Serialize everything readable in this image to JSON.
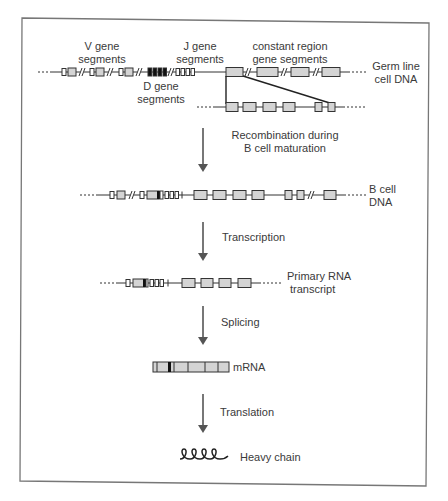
{
  "figure": {
    "stages": {
      "germline": {
        "label_v": "V gene\nsegments",
        "label_v_line1": "V gene",
        "label_v_line2": "segments",
        "label_d_line1": "D gene",
        "label_d_line2": "segments",
        "label_j_line1": "J gene",
        "label_j_line2": "segments",
        "label_c_line1": "constant region",
        "label_c_line2": "gene segments",
        "side_label_line1": "Germ line",
        "side_label_line2": "cell DNA"
      },
      "bcell": {
        "side_label_line1": "B cell",
        "side_label_line2": "DNA"
      },
      "primary_rna": {
        "side_label_line1": "Primary RNA",
        "side_label_line2": "transcript"
      },
      "mrna": {
        "side_label": "mRNA"
      },
      "protein": {
        "side_label": "Heavy chain"
      }
    },
    "steps": [
      {
        "line1": "Recombination during",
        "line2": "B cell maturation"
      },
      {
        "line1": "Transcription"
      },
      {
        "line1": "Splicing"
      },
      {
        "line1": "Translation"
      }
    ],
    "colors": {
      "segment_fill": "#d4d4d4",
      "d_segment_fill": "#111111",
      "line": "#333333",
      "arrow": "#555555",
      "text": "#3a3a3a",
      "frame": "#777777"
    }
  }
}
